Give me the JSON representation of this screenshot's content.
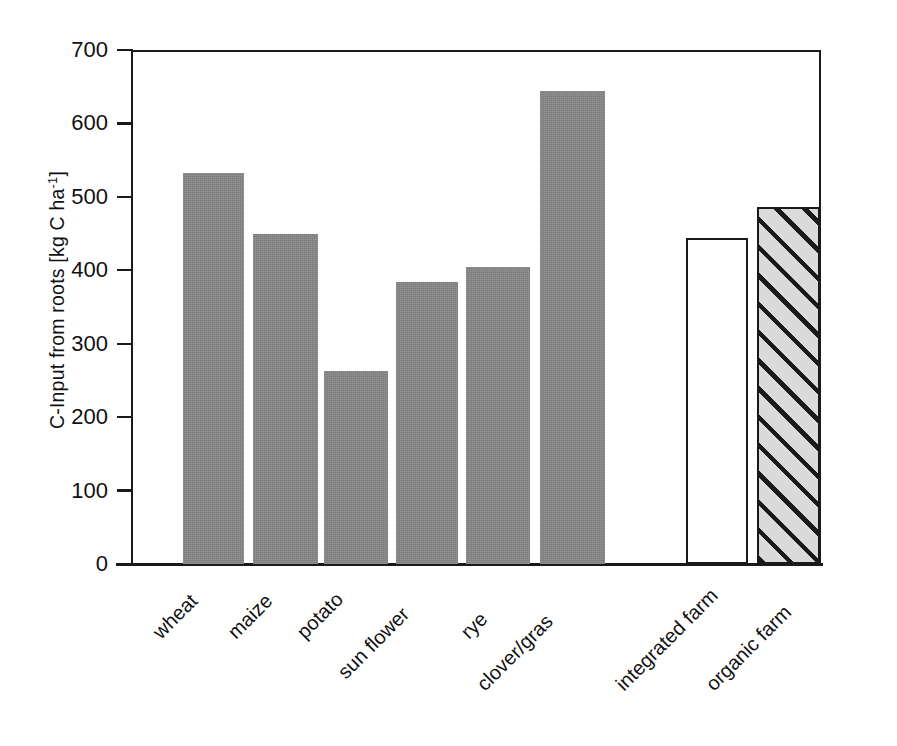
{
  "chart_data": {
    "type": "bar",
    "title": "",
    "subtitle": "",
    "xlabel": "",
    "ylabel": "C-Input from roots [kg C ha-1]",
    "ylabel_main": "C-Input from roots [kg C ha",
    "ylabel_exponent": "-1",
    "ylabel_close": "]",
    "ylim": [
      0,
      700
    ],
    "ytick_values": [
      0,
      100,
      200,
      300,
      400,
      500,
      600,
      700
    ],
    "ytick_labels": [
      "0",
      "100",
      "200",
      "300",
      "400",
      "500",
      "600",
      "700"
    ],
    "grid": false,
    "legend": "none",
    "categories": [
      "wheat",
      "maize",
      "potato",
      "sun flower",
      "rye",
      "clover/gras",
      "integrated farm",
      "organic farm"
    ],
    "values": [
      533,
      450,
      263,
      384,
      404,
      644,
      444,
      486
    ],
    "bars": [
      {
        "label": "wheat",
        "value": 533,
        "style": "solid-gray",
        "group": "crops"
      },
      {
        "label": "maize",
        "value": 450,
        "style": "solid-gray",
        "group": "crops"
      },
      {
        "label": "potato",
        "value": 263,
        "style": "solid-gray",
        "group": "crops"
      },
      {
        "label": "sun flower",
        "value": 384,
        "style": "solid-gray",
        "group": "crops"
      },
      {
        "label": "rye",
        "value": 404,
        "style": "solid-gray",
        "group": "crops"
      },
      {
        "label": "clover/gras",
        "value": 644,
        "style": "solid-gray",
        "group": "crops"
      },
      {
        "label": "integrated farm",
        "value": 444,
        "style": "open-white",
        "group": "farm-type"
      },
      {
        "label": "organic farm",
        "value": 486,
        "style": "hatched-gray",
        "group": "farm-type"
      }
    ],
    "colors": {
      "bar_gray": "#878787",
      "bar_open_fill": "#ffffff",
      "bar_hatch_fill": "#dadada",
      "axis": "#1a1a1a",
      "background": "#ffffff",
      "text": "#111111"
    }
  }
}
